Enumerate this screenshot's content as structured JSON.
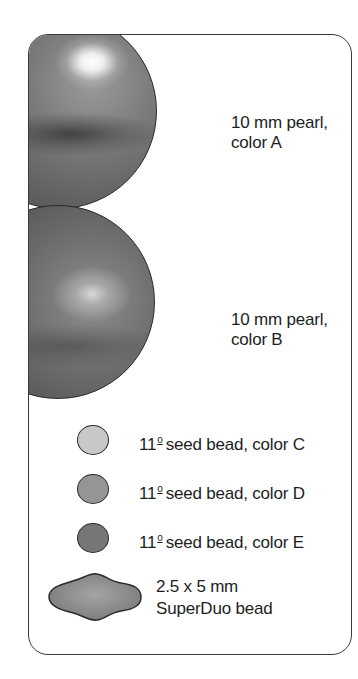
{
  "legend": {
    "items": [
      {
        "id": "pearl-a",
        "shape": "sphere",
        "size_label": "10 mm pearl,",
        "color_label": "color A",
        "fill": "#6e6e6e"
      },
      {
        "id": "pearl-b",
        "shape": "sphere",
        "size_label": "10 mm pearl,",
        "color_label": "color B",
        "fill": "#626262"
      },
      {
        "id": "seed-c",
        "shape": "circle",
        "number": "11",
        "superscript": "o",
        "label": "seed bead, color C",
        "fill": "#c8c8c8"
      },
      {
        "id": "seed-d",
        "shape": "circle",
        "number": "11",
        "superscript": "o",
        "label": "seed bead, color D",
        "fill": "#959595"
      },
      {
        "id": "seed-e",
        "shape": "circle",
        "number": "11",
        "superscript": "o",
        "label": "seed bead, color E",
        "fill": "#767676"
      },
      {
        "id": "superduo",
        "shape": "superduo",
        "size_label": "2.5 x 5 mm",
        "name_label": "SuperDuo bead",
        "fill": "#8a8a8a"
      }
    ]
  },
  "colors": {
    "frame_border": "#3a3a3a",
    "text": "#1e1e1e",
    "background": "#ffffff"
  }
}
